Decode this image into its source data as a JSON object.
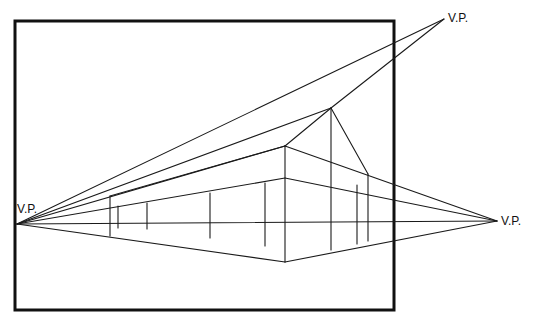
{
  "diagram": {
    "type": "two-point perspective drawing with third vanishing point",
    "labels": {
      "vp_left": "V.P.",
      "vp_right": "V.P.",
      "vp_top": "V.P."
    },
    "colors": {
      "ink": "#1a1a1a",
      "frame": "#111111",
      "background": "#ffffff"
    }
  }
}
